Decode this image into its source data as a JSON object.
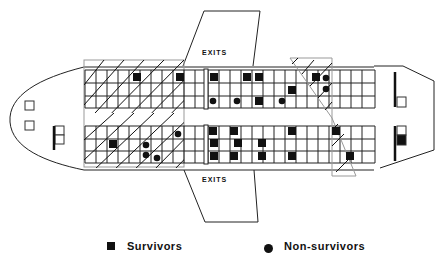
{
  "diagram": {
    "type": "aircraft seating chart",
    "exit_labels": {
      "top": "EXITS",
      "bottom": "EXITS"
    },
    "legend": {
      "survivors": {
        "label": "Survivors",
        "symbol": "filled-square"
      },
      "non_survivors": {
        "label": "Non-survivors",
        "symbol": "filled-circle"
      }
    },
    "colors": {
      "ink": "#111111",
      "background": "#ffffff",
      "grid": "#222222",
      "hatch": "#111111"
    },
    "grid": {
      "top_block": {
        "rows": 3,
        "y": [
          70,
          83,
          96,
          108
        ]
      },
      "bottom_block": {
        "rows": 3,
        "y": [
          126,
          139,
          151,
          163
        ]
      },
      "cols_x": [
        85,
        96,
        107,
        118,
        129,
        140,
        151,
        162,
        173,
        184,
        195,
        208,
        219,
        230,
        241,
        252,
        263,
        274,
        285,
        296,
        307,
        318,
        329,
        340,
        351,
        362,
        375
      ]
    },
    "markers": {
      "survivors": [
        {
          "x": 137,
          "y": 77
        },
        {
          "x": 180,
          "y": 77
        },
        {
          "x": 214,
          "y": 77
        },
        {
          "x": 247,
          "y": 77
        },
        {
          "x": 259,
          "y": 77
        },
        {
          "x": 316,
          "y": 77
        },
        {
          "x": 292,
          "y": 90
        },
        {
          "x": 259,
          "y": 101
        },
        {
          "x": 113,
          "y": 144
        },
        {
          "x": 213,
          "y": 131
        },
        {
          "x": 234,
          "y": 131
        },
        {
          "x": 292,
          "y": 131
        },
        {
          "x": 336,
          "y": 131
        },
        {
          "x": 214,
          "y": 143
        },
        {
          "x": 238,
          "y": 143
        },
        {
          "x": 262,
          "y": 143
        },
        {
          "x": 214,
          "y": 156
        },
        {
          "x": 234,
          "y": 156
        },
        {
          "x": 262,
          "y": 156
        },
        {
          "x": 292,
          "y": 156
        },
        {
          "x": 350,
          "y": 156
        }
      ],
      "non_survivors": [
        {
          "x": 213,
          "y": 101
        },
        {
          "x": 237,
          "y": 101
        },
        {
          "x": 282,
          "y": 101
        },
        {
          "x": 326,
          "y": 78
        },
        {
          "x": 326,
          "y": 89
        },
        {
          "x": 178,
          "y": 134
        },
        {
          "x": 146,
          "y": 145
        },
        {
          "x": 146,
          "y": 155
        },
        {
          "x": 157,
          "y": 158
        }
      ]
    }
  }
}
